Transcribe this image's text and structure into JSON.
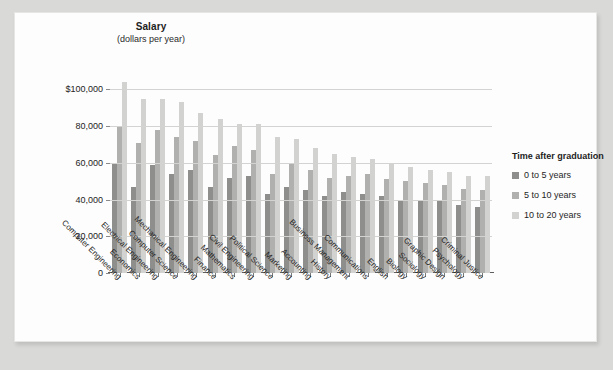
{
  "chart_data": {
    "type": "bar",
    "title": "Salary",
    "subtitle": "(dollars per year)",
    "ylabel": "Salary (dollars per year)",
    "xlabel": "",
    "grid": true,
    "legend_position": "right",
    "ylim": [
      0,
      110000
    ],
    "yticks": [
      0,
      20000,
      40000,
      60000,
      80000,
      100000
    ],
    "ytick_labels": [
      "0",
      "20,000",
      "40,000",
      "60,000",
      "80,000",
      "$100,000"
    ],
    "legend_title": "Time after graduation",
    "categories": [
      "Computer Engineering",
      "Economics",
      "Electrical Engineering",
      "Computer Science",
      "Mechanical Engineering",
      "Finance",
      "Mathematics",
      "Civil Engineering",
      "Political Science",
      "Marketing",
      "Accounting",
      "History",
      "Business Management",
      "Communications",
      "English",
      "Biology",
      "Sociology",
      "Graphic Design",
      "Psychology",
      "Criminal Justice"
    ],
    "series": [
      {
        "name": "0 to 5 years",
        "color": "#8e8e8c",
        "values": [
          60000,
          47000,
          59000,
          54000,
          56000,
          47000,
          52000,
          53000,
          43000,
          47000,
          45000,
          42000,
          44000,
          43000,
          42000,
          40000,
          40000,
          39000,
          37000,
          36000
        ]
      },
      {
        "name": "5 to 10 years",
        "color": "#b0b0ae",
        "values": [
          80000,
          71000,
          78000,
          74000,
          72000,
          64000,
          69000,
          67000,
          54000,
          60000,
          56000,
          52000,
          53000,
          54000,
          51000,
          50000,
          49000,
          48000,
          46000,
          45000
        ]
      },
      {
        "name": "10 to 20 years",
        "color": "#d2d2d0",
        "values": [
          104000,
          95000,
          95000,
          93000,
          87000,
          84000,
          81000,
          81000,
          74000,
          73000,
          68000,
          65000,
          63000,
          62000,
          60000,
          58000,
          56000,
          55000,
          53000,
          53000
        ]
      }
    ]
  }
}
